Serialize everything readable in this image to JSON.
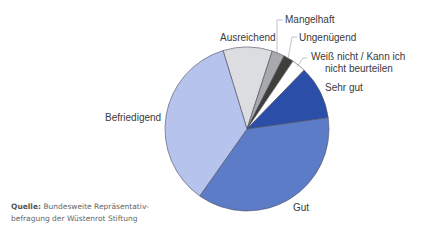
{
  "chart_data": {
    "type": "pie",
    "title": "",
    "start_angle_deg": -17,
    "direction": "clockwise",
    "slices": [
      {
        "label": "Ausreichend",
        "value": 9.7,
        "color": "#dcdde0"
      },
      {
        "label": "Mangelhaft",
        "value": 2.5,
        "color": "#a8a9ad"
      },
      {
        "label": "Ungenügend",
        "value": 2.0,
        "color": "#3d3f38"
      },
      {
        "label": "Weiß nicht / Kann ich nicht beurteilen",
        "value": 2.8,
        "color": "#ffffff"
      },
      {
        "label": "Sehr gut",
        "value": 10.5,
        "color": "#2b4ea8"
      },
      {
        "label": "Gut",
        "value": 37.0,
        "color": "#5c7cc8"
      },
      {
        "label": "Befriedigend",
        "value": 35.5,
        "color": "#b6c3ec"
      }
    ],
    "legend": "none (direct labels)"
  },
  "labels": {
    "mangelhaft": "Mangelhaft",
    "ausreichend": "Ausreichend",
    "ungenuegend": "Ungenügend",
    "weiss_nicht_1": "Weiß nicht / Kann ich",
    "weiss_nicht_2": "nicht beurteilen",
    "sehr_gut": "Sehr gut",
    "befriedigend": "Befriedigend",
    "gut": "Gut"
  },
  "source": {
    "prefix": "Quelle:",
    "line1": " Bundesweite Repräsentativ-",
    "line2": "befragung der Wüstenrot Stiftung"
  }
}
